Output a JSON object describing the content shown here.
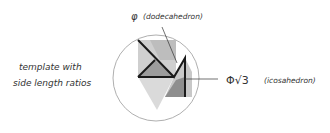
{
  "labels": {
    "left_line1": "template with",
    "left_line2": "side length ratios",
    "top_symbol": "φ",
    "top_text": "(dodecahedron)",
    "right_symbol": "Φ√3",
    "right_text": "(icosahedron)"
  },
  "colors": {
    "circle": "#9a9a9a",
    "line": "#1a1a1a",
    "light_gray": "#d6d6d6",
    "mid_gray": "#b4b4b4",
    "dark_gray": "#8c8c8c",
    "text": "#333333"
  }
}
